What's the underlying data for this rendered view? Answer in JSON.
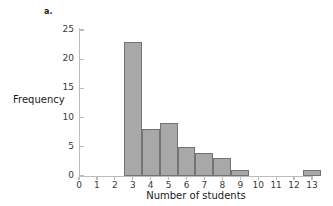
{
  "figure": {
    "panel_label": "a.",
    "background": "#ffffff"
  },
  "style": {
    "bar_fill": "#a8a8a8",
    "bar_stroke": "#737373",
    "axis_color": "#bcbcbc",
    "text_color": "#1a1a1a",
    "tick_text_color": "#3a3a3a"
  },
  "chart_data": {
    "type": "bar",
    "title": "",
    "subtitle": "",
    "xlabel": "Number of students",
    "ylabel": "Frequency",
    "categories": [
      0,
      1,
      2,
      3,
      4,
      5,
      6,
      7,
      8,
      9,
      10,
      11,
      12,
      13
    ],
    "values": [
      0,
      0,
      0,
      23,
      8,
      9,
      5,
      4,
      3,
      1,
      0,
      0,
      0,
      1
    ],
    "bars": [
      {
        "x": 3,
        "height": 23
      },
      {
        "x": 4,
        "height": 8
      },
      {
        "x": 5,
        "height": 9
      },
      {
        "x": 6,
        "height": 5
      },
      {
        "x": 7,
        "height": 4
      },
      {
        "x": 8,
        "height": 3
      },
      {
        "x": 9,
        "height": 1
      },
      {
        "x": 13,
        "height": 1
      }
    ],
    "bar_width": 1,
    "xlim": [
      -0.5,
      13.5
    ],
    "ylim": [
      0,
      26
    ],
    "xticks": [
      0,
      1,
      2,
      3,
      4,
      5,
      6,
      7,
      8,
      9,
      10,
      11,
      12,
      13
    ],
    "xtick_labels": [
      "0",
      "1",
      "2",
      "3",
      "4",
      "5",
      "6",
      "7",
      "8",
      "9",
      "10",
      "11",
      "12",
      "13"
    ],
    "yticks": [
      0,
      5,
      10,
      15,
      20,
      25
    ],
    "ytick_labels": [
      "0",
      "5",
      "10",
      "15",
      "20",
      "25"
    ],
    "grid": false,
    "legend": null
  }
}
